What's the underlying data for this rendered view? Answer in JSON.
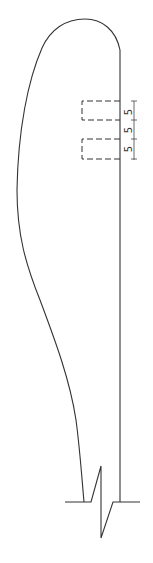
{
  "drawing": {
    "type": "section profile with break line",
    "colors": {
      "line": "#333333",
      "background": "#ffffff"
    },
    "dashed_boxes": [
      {
        "name": "upper-recess",
        "x": 82,
        "y": 101,
        "width": 37,
        "height": 19
      },
      {
        "name": "lower-recess",
        "x": 82,
        "y": 139,
        "width": 37,
        "height": 20
      }
    ],
    "dimensions": [
      {
        "label": "5",
        "y": 112
      },
      {
        "label": "5",
        "y": 130
      },
      {
        "label": "5",
        "y": 149
      }
    ]
  }
}
